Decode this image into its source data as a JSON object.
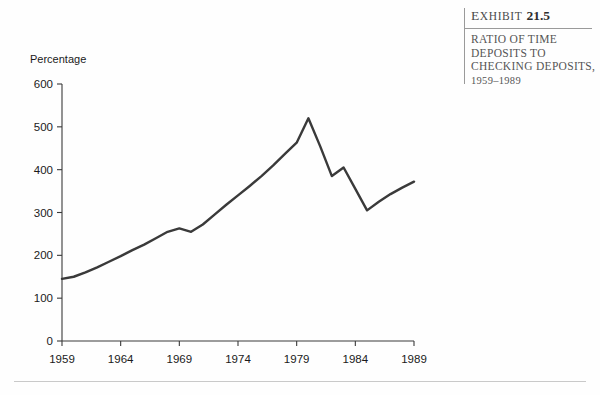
{
  "exhibit": {
    "label_prefix": "E",
    "label_rest": "XHIBIT",
    "number": "21.5",
    "title_lines": [
      "RATIO OF TIME",
      "DEPOSITS TO",
      "CHECKING DEPOSITS,"
    ],
    "title_years": "1959–1989"
  },
  "chart_data": {
    "type": "line",
    "xlabel": "",
    "ylabel": "Percentage",
    "ylabel_position": "top-left",
    "xlim": [
      1959,
      1989
    ],
    "ylim": [
      0,
      600
    ],
    "yticks": [
      0,
      100,
      200,
      300,
      400,
      500,
      600
    ],
    "ytick_labels": [
      "0",
      "100",
      "200",
      "300",
      "400",
      "500",
      "600"
    ],
    "xticks": [
      1959,
      1964,
      1969,
      1974,
      1979,
      1984,
      1989
    ],
    "xtick_labels": [
      "1959",
      "1964",
      "1969",
      "1974",
      "1979",
      "1984",
      "1989"
    ],
    "grid": false,
    "legend": null,
    "line_color": "#3a3a3a",
    "line_width": 2.4,
    "x": [
      1959,
      1960,
      1961,
      1962,
      1963,
      1964,
      1965,
      1966,
      1967,
      1968,
      1969,
      1970,
      1971,
      1972,
      1973,
      1974,
      1975,
      1976,
      1977,
      1978,
      1979,
      1980,
      1981,
      1982,
      1983,
      1984,
      1985,
      1986,
      1987,
      1988,
      1989
    ],
    "values": [
      145,
      150,
      160,
      172,
      185,
      198,
      212,
      225,
      240,
      255,
      263,
      255,
      272,
      295,
      318,
      340,
      362,
      385,
      410,
      437,
      463,
      520,
      455,
      385,
      405,
      355,
      305,
      325,
      343,
      358,
      372
    ],
    "annotations": [
      {
        "label": "peak",
        "x": 1980,
        "y": 520
      },
      {
        "label": "local-dip",
        "x": 1970,
        "y": 255
      },
      {
        "label": "trough",
        "x": 1985,
        "y": 305
      }
    ]
  }
}
